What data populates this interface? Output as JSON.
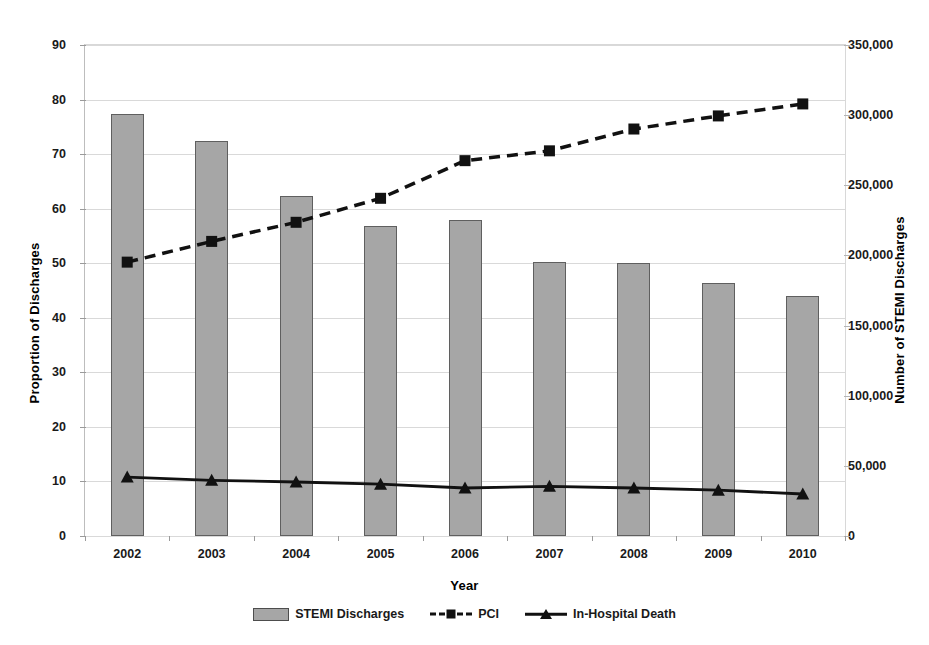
{
  "chart_data": {
    "type": "bar",
    "title": "",
    "xlabel": "Year",
    "ylabel": "Proportion of Discharges",
    "ylabel_right": "Number of STEMI Discharges",
    "grid": true,
    "legend_position": "bottom",
    "categories": [
      "2002",
      "2003",
      "2004",
      "2005",
      "2006",
      "2007",
      "2008",
      "2009",
      "2010"
    ],
    "ylim": [
      0,
      90
    ],
    "yticks": [
      0,
      10,
      20,
      30,
      40,
      50,
      60,
      70,
      80,
      90
    ],
    "ytick_labels": [
      "0",
      "10",
      "20",
      "30",
      "40",
      "50",
      "60",
      "70",
      "80",
      "90"
    ],
    "ylim_right": [
      0,
      350000
    ],
    "yticks_right": [
      0,
      50000,
      100000,
      150000,
      200000,
      250000,
      300000,
      350000
    ],
    "ytick_labels_right": [
      "0",
      "50,000",
      "100,000",
      "150,000",
      "200,000",
      "250,000",
      "300,000",
      "350,000"
    ],
    "series": [
      {
        "name": "STEMI Discharges",
        "kind": "bar",
        "axis": "right",
        "values": [
          77.4,
          72.4,
          62.3,
          56.8,
          58.0,
          50.2,
          50.0,
          46.4,
          44.0
        ],
        "values_right_axis": [
          301000,
          281500,
          242000,
          221000,
          225500,
          195000,
          194500,
          180500,
          171000
        ],
        "color": "#a6a6a6"
      },
      {
        "name": "PCI",
        "kind": "line",
        "axis": "left",
        "style": "dashed",
        "marker": "square",
        "values": [
          50.2,
          54.0,
          57.5,
          61.9,
          68.8,
          70.6,
          74.6,
          77.0,
          79.2
        ],
        "color": "#111111"
      },
      {
        "name": "In-Hospital Death",
        "kind": "line",
        "axis": "left",
        "style": "solid",
        "marker": "triangle",
        "values": [
          10.8,
          10.2,
          9.9,
          9.5,
          8.8,
          9.1,
          8.8,
          8.4,
          7.7
        ],
        "color": "#111111"
      }
    ],
    "legend": [
      {
        "label": "STEMI Discharges",
        "swatch": "bar-swatch"
      },
      {
        "label": "PCI",
        "swatch": "dashed-square-swatch"
      },
      {
        "label": "In-Hospital Death",
        "swatch": "solid-triangle-swatch"
      }
    ]
  }
}
